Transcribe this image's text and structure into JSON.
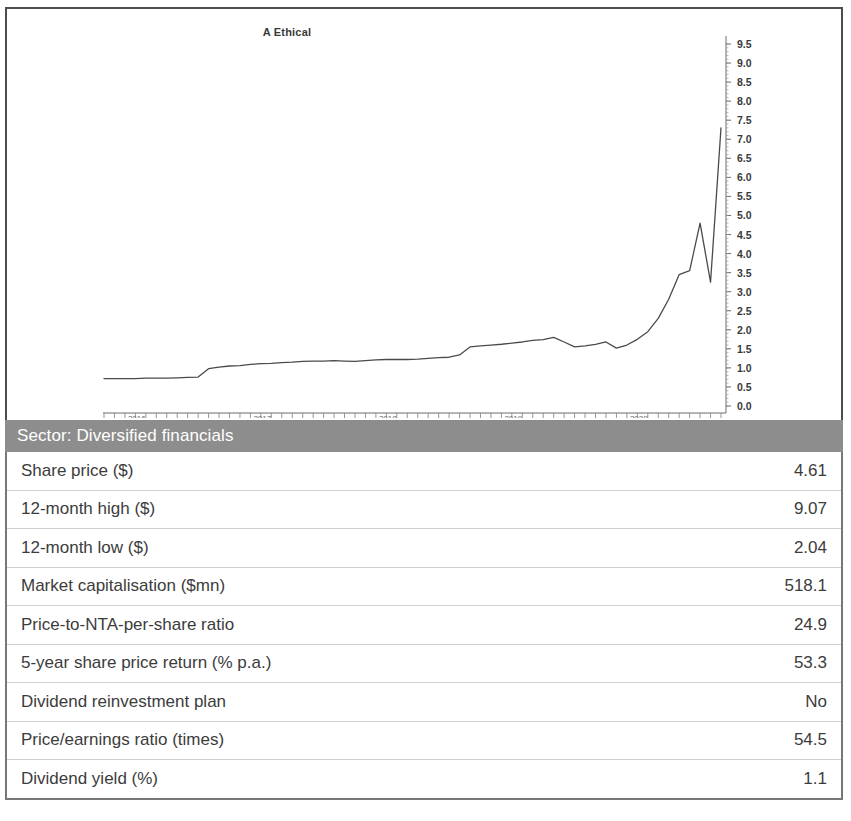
{
  "chart_data": {
    "type": "line",
    "title": "A Ethical",
    "xlabel": "",
    "ylabel": "",
    "ylim": [
      0.0,
      9.5
    ],
    "grid": false,
    "legend": "none",
    "y_ticks": [
      "0.0",
      "0.5",
      "1.0",
      "1.5",
      "2.0",
      "2.5",
      "3.0",
      "3.5",
      "4.0",
      "4.5",
      "5.0",
      "5.5",
      "6.0",
      "6.5",
      "7.0",
      "7.5",
      "8.0",
      "8.5",
      "9.0",
      "9.5"
    ],
    "x_ticks": [
      "2016",
      "2017",
      "2018",
      "2019",
      "2020"
    ],
    "x_tick_interval": "monthly",
    "series": [
      {
        "name": "Share price ($)",
        "x": [
          "2015-11",
          "2015-12",
          "2016-01",
          "2016-02",
          "2016-03",
          "2016-04",
          "2016-05",
          "2016-06",
          "2016-07",
          "2016-08",
          "2016-09",
          "2016-10",
          "2016-11",
          "2016-12",
          "2017-01",
          "2017-02",
          "2017-03",
          "2017-04",
          "2017-05",
          "2017-06",
          "2017-07",
          "2017-08",
          "2017-09",
          "2017-10",
          "2017-11",
          "2017-12",
          "2018-01",
          "2018-02",
          "2018-03",
          "2018-04",
          "2018-05",
          "2018-06",
          "2018-07",
          "2018-08",
          "2018-09",
          "2018-10",
          "2018-11",
          "2018-12",
          "2019-01",
          "2019-02",
          "2019-03",
          "2019-04",
          "2019-05",
          "2019-06",
          "2019-07",
          "2019-08",
          "2019-09",
          "2019-10",
          "2019-11",
          "2019-12",
          "2020-01",
          "2020-02",
          "2020-03",
          "2020-04",
          "2020-05",
          "2020-06",
          "2020-07",
          "2020-08",
          "2020-09",
          "2020-10"
        ],
        "values": [
          0.72,
          0.72,
          0.72,
          0.72,
          0.73,
          0.73,
          0.73,
          0.74,
          0.75,
          0.76,
          0.98,
          1.02,
          1.05,
          1.06,
          1.09,
          1.11,
          1.12,
          1.14,
          1.15,
          1.17,
          1.18,
          1.18,
          1.19,
          1.18,
          1.17,
          1.19,
          1.21,
          1.22,
          1.22,
          1.22,
          1.23,
          1.25,
          1.27,
          1.28,
          1.34,
          1.55,
          1.58,
          1.6,
          1.62,
          1.65,
          1.68,
          1.72,
          1.74,
          1.8,
          1.68,
          1.55,
          1.58,
          1.62,
          1.68,
          1.52,
          1.6,
          1.75,
          1.95,
          2.3,
          2.8,
          3.45,
          3.55,
          4.8,
          3.25,
          7.3
        ]
      }
    ],
    "annotations": {
      "peak_value": 7.3,
      "final_value": 4.61,
      "start_value": 0.72
    }
  },
  "sector": {
    "label": "Sector: Diversified financials"
  },
  "table": {
    "rows": [
      {
        "label": "Share price ($)",
        "value": "4.61"
      },
      {
        "label": "12-month high ($)",
        "value": "9.07"
      },
      {
        "label": "12-month low ($)",
        "value": "2.04"
      },
      {
        "label": "Market capitalisation ($mn)",
        "value": "518.1"
      },
      {
        "label": "Price-to-NTA-per-share ratio",
        "value": "24.9"
      },
      {
        "label": "5-year share price return (% p.a.)",
        "value": "53.3"
      },
      {
        "label": "Dividend reinvestment plan",
        "value": "No"
      },
      {
        "label": "Price/earnings ratio (times)",
        "value": "54.5"
      },
      {
        "label": "Dividend yield (%)",
        "value": "1.1"
      }
    ]
  },
  "colors": {
    "sector_bar": "#8d8d8d",
    "line": "#4a4a4a",
    "border": "#4d4d4d",
    "text": "#3c3c3c"
  }
}
